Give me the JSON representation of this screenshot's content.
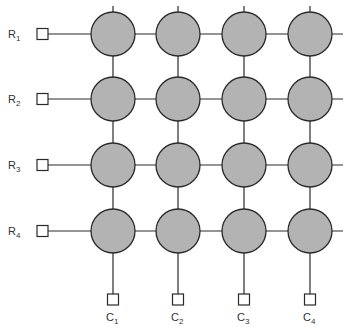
{
  "diagram": {
    "type": "crossbar-array",
    "rows": [
      {
        "label": "R",
        "sub": "1"
      },
      {
        "label": "R",
        "sub": "2"
      },
      {
        "label": "R",
        "sub": "3"
      },
      {
        "label": "R",
        "sub": "4"
      }
    ],
    "columns": [
      {
        "label": "C",
        "sub": "1"
      },
      {
        "label": "C",
        "sub": "2"
      },
      {
        "label": "C",
        "sub": "3"
      },
      {
        "label": "C",
        "sub": "4"
      }
    ],
    "colors": {
      "cell_fill": "#b3b3b3",
      "stroke": "#2a2a2a",
      "terminal_fill": "#ffffff"
    }
  }
}
